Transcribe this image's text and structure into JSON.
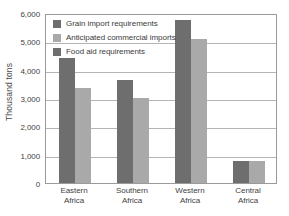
{
  "chart_data": {
    "type": "bar",
    "title": "",
    "xlabel": "",
    "ylabel": "Thousand tons",
    "categories": [
      "Eastern Africa",
      "Southern Africa",
      "Western Africa",
      "Central Africa"
    ],
    "category_lines": [
      [
        "Eastern",
        "Africa"
      ],
      [
        "Southern",
        "Africa"
      ],
      [
        "Western",
        "Africa"
      ],
      [
        "Central",
        "Africa"
      ]
    ],
    "series": [
      {
        "name": "Grain import requirements",
        "color": "#6e6e6e",
        "values": [
          4400,
          3650,
          5750,
          780
        ]
      },
      {
        "name": "Anticipated commercial imports",
        "color": "#a9a9a9",
        "values": [
          3350,
          3000,
          5100,
          770
        ]
      },
      {
        "name": "Food aid requirements",
        "color": "#6e6e6e",
        "values": [
          null,
          null,
          null,
          null
        ]
      }
    ],
    "legend": [
      "Grain import requirements",
      "Anticipated commercial imports",
      "Food aid requirements"
    ],
    "legend_position": "inside-top-left",
    "ylim": [
      0,
      6000
    ],
    "yticks": [
      0,
      1000,
      2000,
      3000,
      4000,
      5000,
      6000
    ],
    "ytick_labels": [
      "0",
      "1,000",
      "2,000",
      "3,000",
      "4,000",
      "5,000",
      "6,000"
    ],
    "grid": true,
    "grid_axis": "y",
    "frame": true
  }
}
